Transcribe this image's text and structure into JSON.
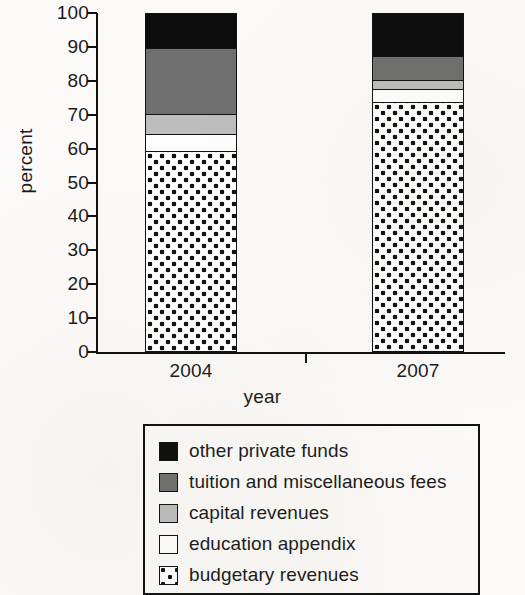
{
  "chart_data": {
    "type": "bar",
    "subtype": "stacked-bar-100-percent",
    "title": "",
    "xlabel": "year",
    "ylabel": "percent",
    "categories": [
      "2004",
      "2007"
    ],
    "ylim": [
      0,
      100
    ],
    "yticks": [
      0,
      10,
      20,
      30,
      40,
      50,
      60,
      70,
      80,
      90,
      100
    ],
    "ytick_labels": [
      "0",
      "10",
      "20",
      "30",
      "40",
      "50",
      "60",
      "70",
      "80",
      "90",
      "100"
    ],
    "grid": false,
    "legend_position": "below-plot",
    "stack_order_bottom_to_top": [
      "budgetary revenues",
      "education appendix",
      "capital revenues",
      "tuition and miscellaneous fees",
      "other private funds"
    ],
    "series": [
      {
        "name": "budgetary revenues",
        "fill": "dotted",
        "color": "#ffffff",
        "values": [
          59.5,
          74
        ]
      },
      {
        "name": "education appendix",
        "fill": "white",
        "color": "#ffffff",
        "values": [
          5,
          4
        ]
      },
      {
        "name": "capital revenues",
        "fill": "solid",
        "color": "#bdbdbd",
        "values": [
          6,
          2.5
        ]
      },
      {
        "name": "tuition and miscellaneous fees",
        "fill": "solid",
        "color": "#6f6f6f",
        "values": [
          19.5,
          7
        ]
      },
      {
        "name": "other private funds",
        "fill": "solid",
        "color": "#0d0d0d",
        "values": [
          10,
          12.5
        ]
      }
    ]
  },
  "axes": {
    "y_title": "percent",
    "x_title": "year",
    "y_labels": [
      "100",
      "90",
      "80",
      "70",
      "60",
      "50",
      "40",
      "30",
      "20",
      "10",
      "0"
    ],
    "x_labels": [
      "2004",
      "2007"
    ]
  },
  "legend": {
    "items": [
      {
        "label": "other private funds",
        "swatch": "black-swatch"
      },
      {
        "label": "tuition and miscellaneous fees",
        "swatch": "dark-gray-swatch"
      },
      {
        "label": "capital revenues",
        "swatch": "light-gray-swatch"
      },
      {
        "label": "education appendix",
        "swatch": "white-swatch"
      },
      {
        "label": "budgetary revenues",
        "swatch": "dotted-swatch"
      }
    ]
  },
  "colors": {
    "other_private_funds": "#0d0d0d",
    "tuition_and_miscellaneous_fees": "#6f6f6f",
    "capital_revenues": "#bdbdbd",
    "education_appendix": "#fdfdfb",
    "budgetary_revenues": "#ffffff",
    "axis": "#111111",
    "background": "#fbfaf8"
  }
}
